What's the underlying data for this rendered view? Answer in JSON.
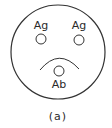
{
  "figure": {
    "panel_label": "(a)",
    "stroke_color": "#333333",
    "background": "#ffffff",
    "outer_circle": {
      "cx": 58,
      "cy": 52,
      "r": 47
    },
    "antigens": [
      {
        "label": "Ag",
        "cx": 41,
        "cy": 39,
        "r": 5,
        "text_x": 41,
        "text_y": 29
      },
      {
        "label": "Ag",
        "cx": 79,
        "cy": 40,
        "r": 5,
        "text_x": 79,
        "text_y": 29
      }
    ],
    "antibody": {
      "label": "Ab",
      "cx": 59,
      "cy": 71,
      "r": 5,
      "text_x": 59,
      "text_y": 88
    },
    "arc": {
      "x1": 40,
      "y1": 70,
      "qx": 59,
      "qy": 47,
      "x2": 79,
      "y2": 69
    }
  }
}
